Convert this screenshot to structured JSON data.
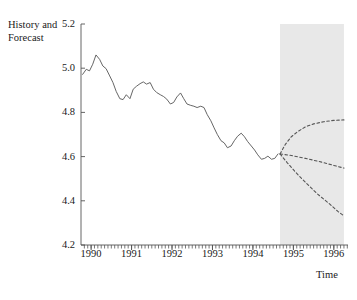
{
  "chart_data": {
    "type": "line",
    "title": "",
    "ylabel": "History and Forecast",
    "xlabel": "Time",
    "ylim": [
      4.2,
      5.2
    ],
    "yticks": [
      "5.2",
      "5.0",
      "4.8",
      "4.6",
      "4.4",
      "4.2"
    ],
    "ytick_values": [
      5.2,
      5.0,
      4.8,
      4.6,
      4.4,
      4.2
    ],
    "xlim": [
      1989.75,
      1996.35
    ],
    "xticks": [
      "1990",
      "1991",
      "1992",
      "1993",
      "1994",
      "1995",
      "1996"
    ],
    "xtick_values": [
      1990,
      1991,
      1992,
      1993,
      1994,
      1995,
      1996
    ],
    "grid": false,
    "legend": "none",
    "forecast_shading": {
      "start": 1994.67,
      "end": 1996.25,
      "color": "#e8e8e8"
    },
    "series": [
      {
        "name": "History",
        "style": "solid",
        "color": "#555555",
        "x": [
          1989.79,
          1989.88,
          1989.96,
          1990.04,
          1990.12,
          1990.21,
          1990.29,
          1990.37,
          1990.46,
          1990.54,
          1990.62,
          1990.71,
          1990.79,
          1990.87,
          1990.96,
          1991.04,
          1991.12,
          1991.21,
          1991.29,
          1991.37,
          1991.46,
          1991.54,
          1991.62,
          1991.71,
          1991.79,
          1991.87,
          1991.96,
          1992.04,
          1992.12,
          1992.21,
          1992.29,
          1992.37,
          1992.46,
          1992.54,
          1992.62,
          1992.71,
          1992.79,
          1992.87,
          1992.96,
          1993.04,
          1993.12,
          1993.21,
          1993.29,
          1993.37,
          1993.46,
          1993.54,
          1993.62,
          1993.71,
          1993.79,
          1993.87,
          1993.96,
          1994.04,
          1994.12,
          1994.21,
          1994.29,
          1994.37,
          1994.46,
          1994.54,
          1994.62
        ],
        "values": [
          4.972,
          4.995,
          4.988,
          5.018,
          5.06,
          5.04,
          5.01,
          4.998,
          4.965,
          4.935,
          4.895,
          4.862,
          4.858,
          4.88,
          4.862,
          4.905,
          4.918,
          4.93,
          4.938,
          4.928,
          4.935,
          4.905,
          4.89,
          4.88,
          4.872,
          4.86,
          4.838,
          4.845,
          4.87,
          4.888,
          4.862,
          4.838,
          4.832,
          4.828,
          4.822,
          4.828,
          4.822,
          4.79,
          4.762,
          4.73,
          4.7,
          4.672,
          4.662,
          4.64,
          4.648,
          4.672,
          4.692,
          4.706,
          4.69,
          4.668,
          4.648,
          4.63,
          4.608,
          4.588,
          4.592,
          4.602,
          4.588,
          4.592,
          4.612
        ]
      },
      {
        "name": "Forecast upper band",
        "style": "dashed",
        "color": "#555555",
        "x": [
          1994.67,
          1994.8,
          1994.95,
          1995.1,
          1995.3,
          1995.5,
          1995.75,
          1996.0,
          1996.25
        ],
        "values": [
          4.612,
          4.655,
          4.69,
          4.712,
          4.735,
          4.748,
          4.758,
          4.764,
          4.766
        ]
      },
      {
        "name": "Forecast central band",
        "style": "dashed",
        "color": "#555555",
        "x": [
          1994.67,
          1994.95,
          1995.3,
          1995.7,
          1996.0,
          1996.25
        ],
        "values": [
          4.612,
          4.605,
          4.592,
          4.575,
          4.56,
          4.548
        ]
      },
      {
        "name": "Forecast lower band",
        "style": "dashed",
        "color": "#555555",
        "x": [
          1994.67,
          1994.85,
          1995.05,
          1995.3,
          1995.6,
          1995.9,
          1996.1,
          1996.25
        ],
        "values": [
          4.612,
          4.572,
          4.53,
          4.483,
          4.43,
          4.385,
          4.352,
          4.332
        ]
      }
    ]
  },
  "axes": {
    "ylabel_text": "History and Forecast",
    "xlabel_text": "Time"
  }
}
